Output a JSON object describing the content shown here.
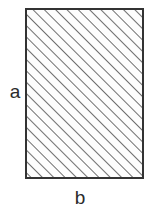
{
  "figure": {
    "type": "cross-section-diagram",
    "background_color": "#ffffff"
  },
  "shape": {
    "name": "rectangle",
    "x": 26,
    "y": 9,
    "width": 117,
    "height": 169,
    "border_color": "#333333",
    "border_width": 1.5,
    "fill_color": "#fdfdfd"
  },
  "hatch": {
    "pattern": "diagonal-lines",
    "direction": "bottom-left-to-top-right",
    "angle_degrees": 45,
    "spacing_px": 8,
    "line_width_px": 1.6,
    "line_color": "#4a4a4a"
  },
  "labels": {
    "height_label": "a",
    "width_label": "b",
    "text_color": "#2b2b2b"
  }
}
